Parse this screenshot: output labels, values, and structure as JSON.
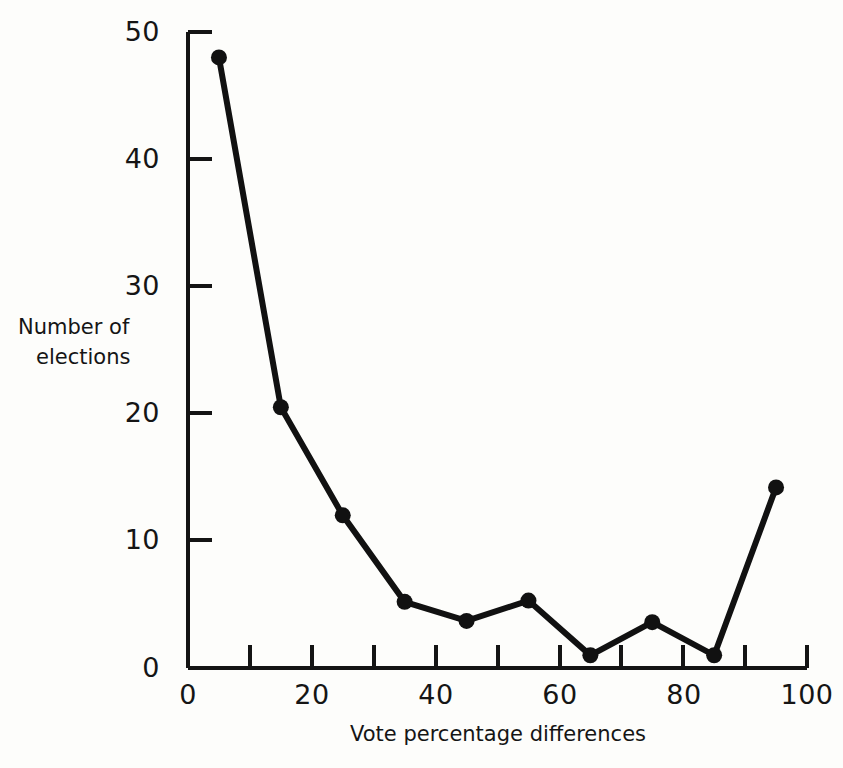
{
  "chart_data": {
    "type": "line",
    "title": "",
    "xlabel": "Vote percentage differences",
    "ylabel": "Number of elections",
    "ylabel_lines": [
      "Number of",
      "elections"
    ],
    "x": [
      5,
      15,
      25,
      35,
      45,
      55,
      65,
      75,
      85,
      95
    ],
    "values": [
      48,
      20.5,
      12,
      5.2,
      3.7,
      5.3,
      1,
      3.6,
      1,
      14.2
    ],
    "series": [
      {
        "name": "Number of elections",
        "values": [
          48,
          20.5,
          12,
          5.2,
          3.7,
          5.3,
          1,
          3.6,
          1,
          14.2
        ]
      }
    ],
    "xlim": [
      0,
      100
    ],
    "ylim": [
      0,
      50
    ],
    "x_tick_values": [
      0,
      10,
      20,
      30,
      40,
      50,
      60,
      70,
      80,
      90,
      100
    ],
    "x_tick_labels": [
      "0",
      "",
      "20",
      "",
      "40",
      "",
      "60",
      "",
      "80",
      "",
      "100"
    ],
    "y_tick_values": [
      0,
      10,
      20,
      30,
      40,
      50
    ],
    "y_tick_labels": [
      "0",
      "10",
      "20",
      "30",
      "40",
      "50"
    ],
    "grid": false,
    "legend": false,
    "marker": "filled-circle",
    "line_color": "#111111",
    "marker_color": "#111111",
    "background_color": "#fdfdfb"
  },
  "axes": {
    "x_labels": [
      {
        "text": "0",
        "value": 0
      },
      {
        "text": "20",
        "value": 20
      },
      {
        "text": "40",
        "value": 40
      },
      {
        "text": "60",
        "value": 60
      },
      {
        "text": "80",
        "value": 80
      },
      {
        "text": "100",
        "value": 100
      }
    ],
    "y_labels": [
      {
        "text": "50",
        "value": 50
      },
      {
        "text": "40",
        "value": 40
      },
      {
        "text": "30",
        "value": 30
      },
      {
        "text": "20",
        "value": 20
      },
      {
        "text": "10",
        "value": 10
      },
      {
        "text": "0",
        "value": 0
      }
    ]
  }
}
